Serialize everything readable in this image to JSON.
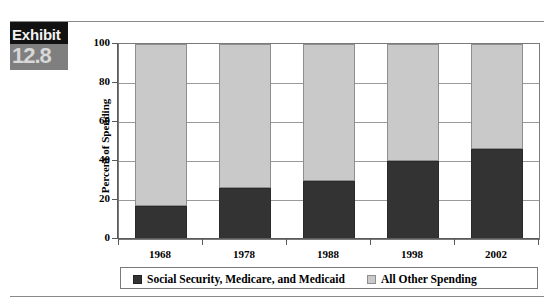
{
  "exhibit": {
    "word": "Exhibit",
    "number": "12.8"
  },
  "chart_data": {
    "type": "bar",
    "stacked": true,
    "title": "",
    "xlabel": "",
    "ylabel": "Percent of Spending",
    "ylim": [
      0,
      100
    ],
    "yticks": [
      0,
      20,
      40,
      60,
      80,
      100
    ],
    "ytick_labels": [
      "0",
      "20",
      "40",
      "60",
      "80",
      "100"
    ],
    "grid": true,
    "legend_position": "bottom",
    "categories": [
      "1968",
      "1978",
      "1988",
      "1998",
      "2002"
    ],
    "series": [
      {
        "name": "Social Security, Medicare, and Medicaid",
        "color": "#333333",
        "values": [
          17,
          26,
          30,
          40,
          46
        ]
      },
      {
        "name": "All Other Spending",
        "color": "#c9c9c9",
        "values": [
          83,
          74,
          70,
          60,
          54
        ]
      }
    ]
  }
}
